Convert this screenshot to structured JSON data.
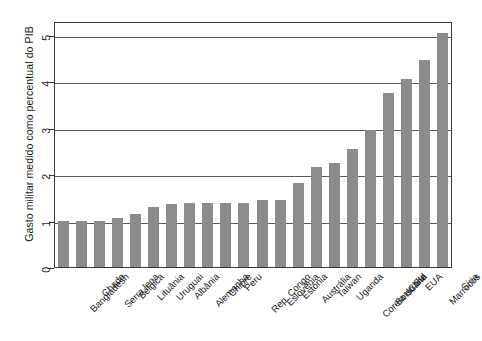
{
  "chart_data": {
    "type": "bar",
    "title": "",
    "subtitle": "",
    "xlabel": "",
    "ylabel": "Gasto militar medido como percentual do PIB",
    "ylim": [
      0,
      5.3
    ],
    "yticks": [
      0,
      1,
      2,
      3,
      4,
      5
    ],
    "ytick_labels": [
      "0",
      "1",
      "2",
      "3",
      "4",
      "5"
    ],
    "grid": true,
    "gridlines_y": [
      1,
      2,
      3,
      4,
      5
    ],
    "legend": null,
    "legend_position": "none",
    "bar_color": "#8c8c8c",
    "axis_color": "#3a3a3a",
    "categories": [
      "Bangladesh",
      "Chade",
      "Serra leoa",
      "Bélgica",
      "Lituânia",
      "Uruguai",
      "Albânia",
      "Alemanha",
      "Chipre",
      "Peru",
      "Rep. Congo",
      "Eslovênia",
      "Estônia",
      "Austrália",
      "Taiwan",
      "Uganda",
      "Coreia do Sul",
      "Botsuana",
      "Chile",
      "EUA",
      "Marrocos",
      "Síria"
    ],
    "values": [
      1.0,
      1.0,
      1.0,
      1.05,
      1.15,
      1.3,
      1.35,
      1.38,
      1.38,
      1.38,
      1.38,
      1.45,
      1.45,
      1.8,
      2.15,
      2.25,
      2.55,
      2.95,
      3.75,
      4.05,
      4.45,
      5.05
    ]
  }
}
